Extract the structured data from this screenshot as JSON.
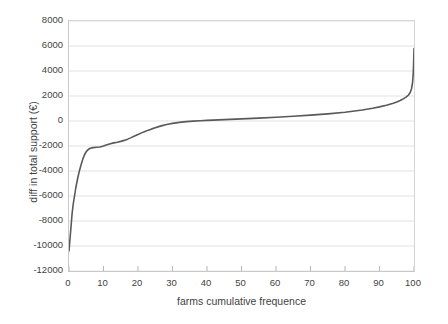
{
  "chart_data": {
    "type": "line",
    "title": "",
    "xlabel": "farms cumulative frequence",
    "ylabel": "diff in total support (€)",
    "xlim": [
      0,
      100
    ],
    "ylim": [
      -12000,
      8000
    ],
    "grid": true,
    "legend": false,
    "line_color": "#595959",
    "xticks": [
      0,
      10,
      20,
      30,
      40,
      50,
      60,
      70,
      80,
      90,
      100
    ],
    "xtick_labels": [
      "0",
      "10",
      "20",
      "30",
      "40",
      "50",
      "60",
      "70",
      "80",
      "90",
      "100"
    ],
    "yticks": [
      -12000,
      -10000,
      -8000,
      -6000,
      -4000,
      -2000,
      0,
      2000,
      4000,
      6000,
      8000
    ],
    "ytick_labels": [
      "-12000",
      "-10000",
      "-8000",
      "-6000",
      "-4000",
      "-2000",
      "0",
      "2000",
      "4000",
      "6000",
      "8000"
    ],
    "series": [
      {
        "name": "diff in total support",
        "x": [
          0.0,
          0.3,
          0.6,
          0.9,
          1.2,
          1.6,
          2.0,
          2.5,
          3.0,
          3.5,
          4.0,
          4.5,
          5.0,
          5.5,
          6.0,
          6.5,
          7.0,
          8.0,
          9.0,
          10.0,
          11.0,
          12.0,
          13.0,
          14.0,
          15.0,
          16.0,
          17.0,
          18.0,
          19.0,
          20.0,
          21.0,
          22.0,
          23.0,
          24.0,
          25.0,
          26.0,
          27.0,
          28.0,
          29.0,
          30.0,
          32.0,
          34.0,
          36.0,
          38.0,
          40.0,
          45.0,
          50.0,
          55.0,
          60.0,
          65.0,
          70.0,
          75.0,
          80.0,
          85.0,
          88.0,
          90.0,
          92.0,
          94.0,
          95.0,
          96.0,
          97.0,
          97.8,
          98.4,
          98.9,
          99.3,
          99.6,
          99.8,
          99.9,
          100.0
        ],
        "y": [
          -10400,
          -9400,
          -8400,
          -7400,
          -6700,
          -6000,
          -5300,
          -4600,
          -4000,
          -3500,
          -3050,
          -2700,
          -2450,
          -2300,
          -2200,
          -2150,
          -2130,
          -2100,
          -2080,
          -2000,
          -1900,
          -1820,
          -1750,
          -1700,
          -1630,
          -1550,
          -1450,
          -1330,
          -1200,
          -1080,
          -950,
          -840,
          -730,
          -630,
          -540,
          -450,
          -370,
          -300,
          -240,
          -190,
          -110,
          -50,
          -10,
          20,
          50,
          110,
          170,
          230,
          300,
          380,
          470,
          570,
          700,
          880,
          1020,
          1130,
          1260,
          1420,
          1520,
          1640,
          1790,
          1930,
          2080,
          2280,
          2600,
          3100,
          3900,
          4700,
          5800
        ]
      }
    ]
  }
}
